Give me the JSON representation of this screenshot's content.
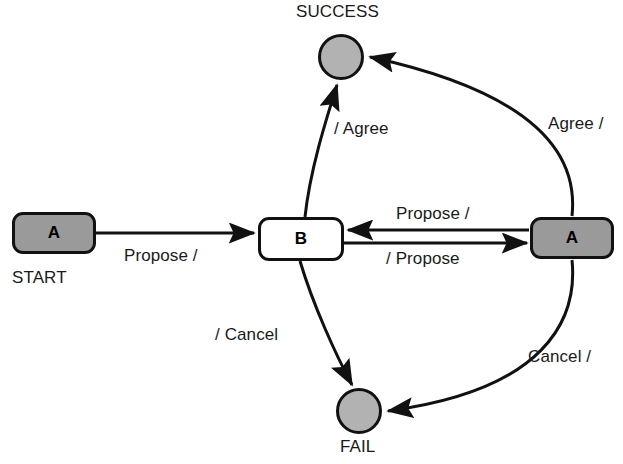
{
  "diagram": {
    "type": "state-diagram",
    "colors": {
      "node_fill_active": "#9a9a9a",
      "node_fill_terminal": "#b2b2b2",
      "node_fill_plain": "#ffffff",
      "stroke": "#111111",
      "text": "#1a1a1a",
      "background": "#ffffff"
    },
    "nodes": [
      {
        "id": "start-a",
        "label": "A",
        "caption": "START",
        "shape": "rounded-rect",
        "fill": "gray"
      },
      {
        "id": "b",
        "label": "B",
        "caption": "",
        "shape": "rounded-rect",
        "fill": "white"
      },
      {
        "id": "right-a",
        "label": "A",
        "caption": "",
        "shape": "rounded-rect",
        "fill": "gray"
      },
      {
        "id": "success",
        "label": "",
        "caption": "SUCCESS",
        "shape": "circle",
        "fill": "gray"
      },
      {
        "id": "fail",
        "label": "",
        "caption": "FAIL",
        "shape": "circle",
        "fill": "gray"
      }
    ],
    "transitions": [
      {
        "id": "t-start-b",
        "from": "start-a",
        "to": "b",
        "label": "Propose /"
      },
      {
        "id": "t-b-success",
        "from": "b",
        "to": "success",
        "label": "/ Agree"
      },
      {
        "id": "t-b-fail",
        "from": "b",
        "to": "fail",
        "label": "/ Cancel"
      },
      {
        "id": "t-a-b",
        "from": "right-a",
        "to": "b",
        "label": "Propose /"
      },
      {
        "id": "t-b-a",
        "from": "b",
        "to": "right-a",
        "label": "/ Propose"
      },
      {
        "id": "t-a-success",
        "from": "right-a",
        "to": "success",
        "label": "Agree /"
      },
      {
        "id": "t-a-fail",
        "from": "right-a",
        "to": "fail",
        "label": "Cancel /"
      }
    ]
  }
}
